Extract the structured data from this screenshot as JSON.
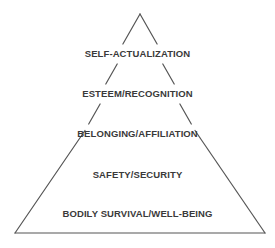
{
  "diagram": {
    "type": "pyramid",
    "line_color": "#555555",
    "text_color": "#3a3a3a",
    "levels": [
      {
        "label": "SELF-ACTUALIZATION",
        "y": 48
      },
      {
        "label": "ESTEEM/RECOGNITION",
        "y": 88
      },
      {
        "label": "BELONGING/AFFILIATION",
        "y": 128
      },
      {
        "label": "SAFETY/SECURITY",
        "y": 169
      },
      {
        "label": "BODILY SURVIVAL/WELL-BEING",
        "y": 208
      }
    ]
  }
}
